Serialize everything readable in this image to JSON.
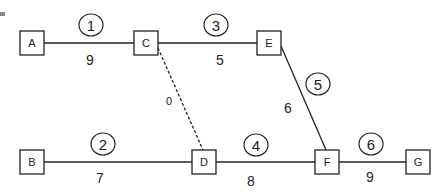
{
  "diagram": {
    "type": "activity-network",
    "nodes": [
      {
        "id": "A",
        "label": "A",
        "x": 32,
        "y": 43
      },
      {
        "id": "C",
        "label": "C",
        "x": 146,
        "y": 43
      },
      {
        "id": "E",
        "label": "E",
        "x": 269,
        "y": 43
      },
      {
        "id": "B",
        "label": "B",
        "x": 32,
        "y": 162
      },
      {
        "id": "D",
        "label": "D",
        "x": 204,
        "y": 162
      },
      {
        "id": "F",
        "label": "F",
        "x": 327,
        "y": 162
      },
      {
        "id": "G",
        "label": "G",
        "x": 418,
        "y": 162
      }
    ],
    "edges": [
      {
        "from": "A",
        "to": "C",
        "activity": "1",
        "duration": "9",
        "dashed": false
      },
      {
        "from": "C",
        "to": "E",
        "activity": "3",
        "duration": "5",
        "dashed": false
      },
      {
        "from": "E",
        "to": "F",
        "activity": "5",
        "duration": "6",
        "dashed": false
      },
      {
        "from": "C",
        "to": "D",
        "activity": "",
        "duration": "0",
        "dashed": true
      },
      {
        "from": "B",
        "to": "D",
        "activity": "2",
        "duration": "7",
        "dashed": false
      },
      {
        "from": "D",
        "to": "F",
        "activity": "4",
        "duration": "8",
        "dashed": false
      },
      {
        "from": "F",
        "to": "G",
        "activity": "6",
        "duration": "9",
        "dashed": false
      }
    ]
  }
}
